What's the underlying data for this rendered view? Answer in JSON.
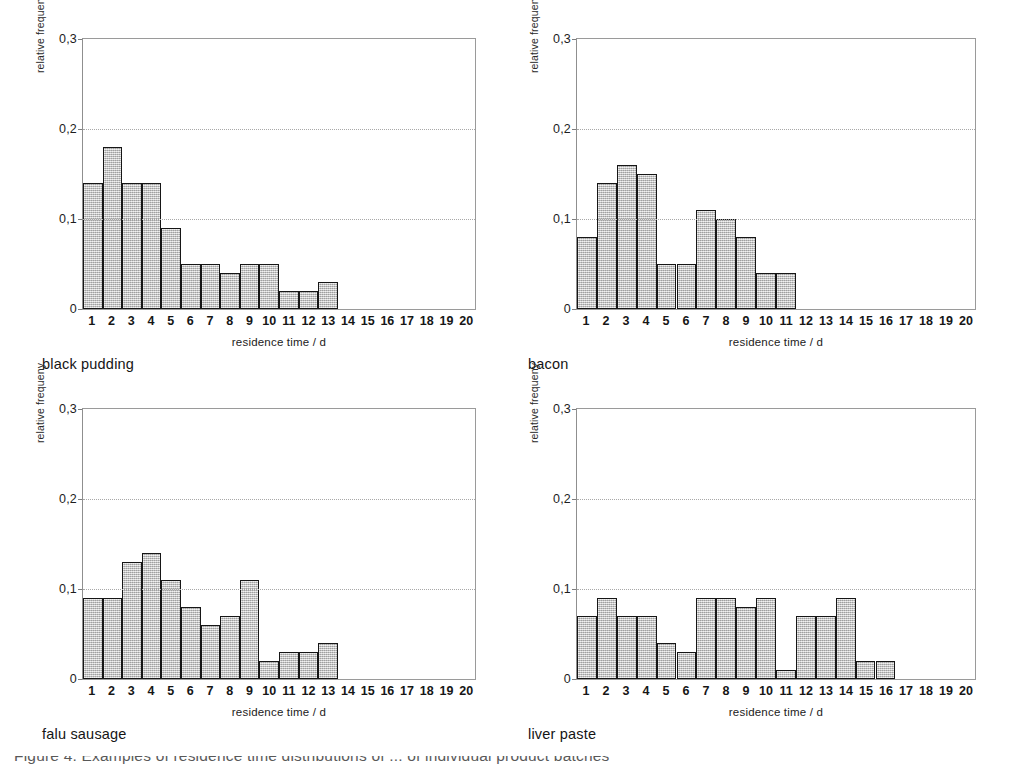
{
  "figure": {
    "background_color": "#ffffff",
    "bar_fill_color": "#c9c9c9",
    "bar_edge_color": "#161616",
    "grid_color": "#a8a8a8",
    "axis_color": "#9a9a9a",
    "footer_caption": "Figure 4. Examples of residence time distributions of ... of individual product batches"
  },
  "axis": {
    "ylabel": "relative frequeny",
    "xlabel": "residence time / d",
    "yticks": [
      "0,3",
      "0,2",
      "0,1",
      "0"
    ],
    "ytick_values": [
      0.3,
      0.2,
      0.1,
      0.0
    ],
    "ylim": [
      0,
      0.3
    ],
    "xticks": [
      "1",
      "2",
      "3",
      "4",
      "5",
      "6",
      "7",
      "8",
      "9",
      "10",
      "11",
      "12",
      "13",
      "14",
      "15",
      "16",
      "17",
      "18",
      "19",
      "20"
    ],
    "xlim": [
      0.5,
      20.5
    ],
    "gridlines": [
      0.1,
      0.2
    ]
  },
  "chart_data": [
    {
      "type": "bar",
      "title": "black pudding",
      "xlabel": "residence time / d",
      "ylabel": "relative frequeny",
      "ylim": [
        0,
        0.3
      ],
      "xlim": [
        0.5,
        20.5
      ],
      "grid": true,
      "legend": "none",
      "categories": [
        "1",
        "2",
        "3",
        "4",
        "5",
        "6",
        "7",
        "8",
        "9",
        "10",
        "11",
        "12",
        "13"
      ],
      "values": [
        0.14,
        0.18,
        0.14,
        0.14,
        0.09,
        0.05,
        0.05,
        0.04,
        0.05,
        0.05,
        0.02,
        0.02,
        0.03
      ]
    },
    {
      "type": "bar",
      "title": "bacon",
      "xlabel": "residence time / d",
      "ylabel": "relative frequeny",
      "ylim": [
        0,
        0.3
      ],
      "xlim": [
        0.5,
        20.5
      ],
      "grid": true,
      "legend": "none",
      "categories": [
        "1",
        "2",
        "3",
        "4",
        "5",
        "6",
        "7",
        "8",
        "9",
        "10",
        "11"
      ],
      "values": [
        0.08,
        0.14,
        0.16,
        0.15,
        0.05,
        0.05,
        0.11,
        0.1,
        0.08,
        0.04,
        0.04
      ]
    },
    {
      "type": "bar",
      "title": "falu sausage",
      "xlabel": "residence time / d",
      "ylabel": "relative frequeny",
      "ylim": [
        0,
        0.3
      ],
      "xlim": [
        0.5,
        20.5
      ],
      "grid": true,
      "legend": "none",
      "categories": [
        "1",
        "2",
        "3",
        "4",
        "5",
        "6",
        "7",
        "8",
        "9",
        "10",
        "11",
        "12",
        "13"
      ],
      "values": [
        0.09,
        0.09,
        0.13,
        0.14,
        0.11,
        0.08,
        0.06,
        0.07,
        0.11,
        0.02,
        0.03,
        0.03,
        0.04
      ]
    },
    {
      "type": "bar",
      "title": "liver paste",
      "xlabel": "residence time / d",
      "ylabel": "relative frequeny",
      "ylim": [
        0,
        0.3
      ],
      "xlim": [
        0.5,
        20.5
      ],
      "grid": true,
      "legend": "none",
      "categories": [
        "1",
        "2",
        "3",
        "4",
        "5",
        "6",
        "7",
        "8",
        "9",
        "10",
        "11",
        "12",
        "13",
        "14",
        "15",
        "16"
      ],
      "values": [
        0.07,
        0.09,
        0.07,
        0.07,
        0.04,
        0.03,
        0.09,
        0.09,
        0.08,
        0.09,
        0.01,
        0.07,
        0.07,
        0.09,
        0.02,
        0.02
      ]
    }
  ]
}
